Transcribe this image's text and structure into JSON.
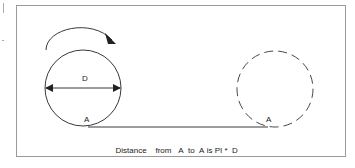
{
  "diagram": {
    "labels": {
      "diameter": "D",
      "start_point": "A",
      "end_point": "A"
    },
    "caption": {
      "word1": "Distance",
      "word2": "from",
      "word3": "A",
      "word4": "to",
      "word5": "A",
      "word6": "is",
      "word7": "PI",
      "word8": "*",
      "word9": "D"
    },
    "colors": {
      "line": "#222222",
      "frame": "#9a9a9a"
    }
  }
}
